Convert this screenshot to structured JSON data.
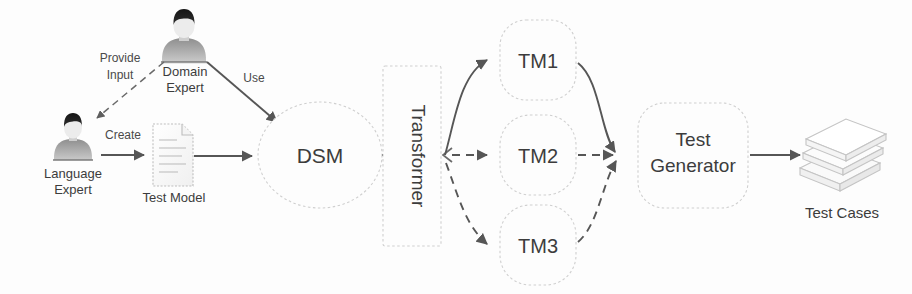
{
  "diagram": {
    "background_color": "#fdfdfd",
    "stroke_color": "#565656",
    "shape_stroke_color": "#d2d2d2",
    "text_color": "#3c3c3c"
  },
  "actors": [
    {
      "id": "domain-expert",
      "label_line1": "Domain",
      "label_line2": "Expert",
      "icon": "person-avatar-icon"
    },
    {
      "id": "language-expert",
      "label_line1": "Language",
      "label_line2": "Expert",
      "icon": "person-avatar-icon"
    }
  ],
  "artifacts": [
    {
      "id": "test-model",
      "label": "Test Model",
      "icon": "document-icon"
    },
    {
      "id": "test-cases",
      "label": "Test Cases",
      "icon": "document-stack-icon"
    }
  ],
  "nodes": [
    {
      "id": "dsm",
      "label": "DSM",
      "shape": "ellipse"
    },
    {
      "id": "transformer",
      "label": "Transformer",
      "shape": "rectangle",
      "orientation": "vertical"
    },
    {
      "id": "tm1",
      "label": "TM1",
      "shape": "rounded-rectangle"
    },
    {
      "id": "tm2",
      "label": "TM2",
      "shape": "rounded-rectangle"
    },
    {
      "id": "tm3",
      "label": "TM3",
      "shape": "rounded-rectangle"
    },
    {
      "id": "test-generator",
      "label_line1": "Test",
      "label_line2": "Generator",
      "shape": "rounded-rectangle"
    }
  ],
  "edges": [
    {
      "id": "provide-input",
      "label_line1": "Provide",
      "label_line2": "Input",
      "from": "domain-expert",
      "to": "language-expert",
      "style": "dashed"
    },
    {
      "id": "use",
      "label": "Use",
      "from": "domain-expert",
      "to": "dsm",
      "style": "solid"
    },
    {
      "id": "create",
      "label": "Create",
      "from": "language-expert",
      "to": "test-model",
      "style": "solid"
    },
    {
      "id": "model-to-dsm",
      "label": "",
      "from": "test-model",
      "to": "dsm",
      "style": "solid"
    },
    {
      "id": "dsm-to-transformer",
      "label": "",
      "from": "dsm",
      "to": "transformer",
      "style": "solid"
    },
    {
      "id": "transformer-to-tm1",
      "label": "",
      "from": "transformer",
      "to": "tm1",
      "style": "solid"
    },
    {
      "id": "transformer-to-tm2",
      "label": "",
      "from": "transformer",
      "to": "tm2",
      "style": "dashed"
    },
    {
      "id": "transformer-to-tm3",
      "label": "",
      "from": "transformer",
      "to": "tm3",
      "style": "dashed"
    },
    {
      "id": "tm1-to-generator",
      "label": "",
      "from": "tm1",
      "to": "test-generator",
      "style": "solid"
    },
    {
      "id": "tm2-to-generator",
      "label": "",
      "from": "tm2",
      "to": "test-generator",
      "style": "dashed"
    },
    {
      "id": "tm3-to-generator",
      "label": "",
      "from": "tm3",
      "to": "test-generator",
      "style": "dashed"
    },
    {
      "id": "generator-to-cases",
      "label": "",
      "from": "test-generator",
      "to": "test-cases",
      "style": "solid"
    }
  ]
}
